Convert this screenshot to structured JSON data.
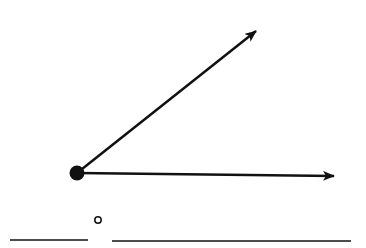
{
  "diagram": {
    "type": "angle",
    "vertex": {
      "x": 77,
      "y": 173
    },
    "rays": [
      {
        "name": "upper-ray",
        "end": {
          "x": 258,
          "y": 29
        }
      },
      {
        "name": "lower-ray",
        "end": {
          "x": 336,
          "y": 176
        }
      }
    ],
    "answer_blanks": [
      {
        "name": "degree-blank",
        "x1": 10,
        "x2": 88,
        "y": 240
      },
      {
        "name": "angle-type-blank",
        "x1": 112,
        "x2": 351,
        "y": 240
      }
    ],
    "degree_symbol": "°",
    "stroke_color": "#111111"
  }
}
